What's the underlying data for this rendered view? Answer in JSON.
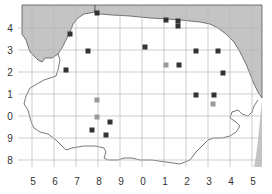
{
  "map": {
    "colors": {
      "sea": "#c4c4c4",
      "land": "#ffffff",
      "grid": "#b8b8b8",
      "coast": "#555555",
      "marker_dark": "#333333",
      "marker_light": "#9a9a9a"
    },
    "x_axis": {
      "labels": [
        "5",
        "6",
        "7",
        "8",
        "9",
        "0",
        "1",
        "2",
        "3",
        "4",
        "5"
      ],
      "positions": [
        32,
        54,
        76,
        98,
        120,
        142,
        164,
        186,
        208,
        230,
        252
      ]
    },
    "y_axis": {
      "labels": [
        "4",
        "3",
        "2",
        "1",
        "0",
        "9",
        "8"
      ],
      "positions": [
        28,
        50,
        72,
        94,
        116,
        138,
        160
      ]
    },
    "markers": [
      {
        "x": 97,
        "y": 13,
        "tone": "dark"
      },
      {
        "x": 70,
        "y": 34,
        "tone": "dark"
      },
      {
        "x": 88,
        "y": 51,
        "tone": "dark"
      },
      {
        "x": 66,
        "y": 70,
        "tone": "dark"
      },
      {
        "x": 145,
        "y": 47,
        "tone": "dark"
      },
      {
        "x": 166,
        "y": 20,
        "tone": "dark"
      },
      {
        "x": 178,
        "y": 21,
        "tone": "dark"
      },
      {
        "x": 178,
        "y": 26,
        "tone": "dark"
      },
      {
        "x": 196,
        "y": 51,
        "tone": "dark"
      },
      {
        "x": 218,
        "y": 51,
        "tone": "dark"
      },
      {
        "x": 166,
        "y": 65,
        "tone": "light"
      },
      {
        "x": 179,
        "y": 65,
        "tone": "dark"
      },
      {
        "x": 223,
        "y": 73,
        "tone": "dark"
      },
      {
        "x": 196,
        "y": 95,
        "tone": "dark"
      },
      {
        "x": 214,
        "y": 95,
        "tone": "dark"
      },
      {
        "x": 213,
        "y": 104,
        "tone": "light"
      },
      {
        "x": 97,
        "y": 100,
        "tone": "light"
      },
      {
        "x": 97,
        "y": 117,
        "tone": "light"
      },
      {
        "x": 110,
        "y": 122,
        "tone": "dark"
      },
      {
        "x": 92,
        "y": 130,
        "tone": "dark"
      },
      {
        "x": 106,
        "y": 135,
        "tone": "dark"
      }
    ]
  }
}
